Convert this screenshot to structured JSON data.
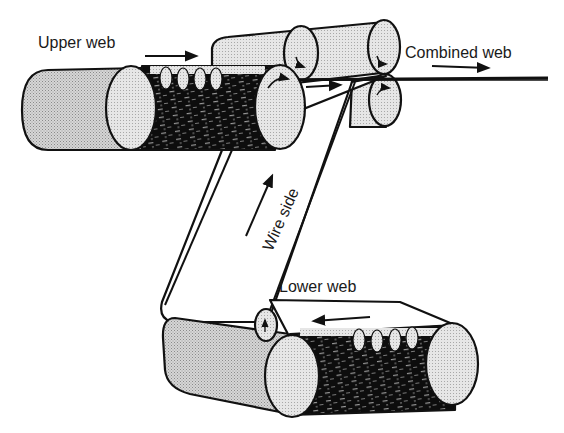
{
  "diagram": {
    "type": "process-schematic",
    "labels": {
      "upper_web": "Upper web",
      "combined_web": "Combined web",
      "wire_side": "Wire side",
      "lower_web": "Lower web"
    },
    "components": [
      {
        "id": "upper-wire-cylinder",
        "description": "Upper forming cylinder with wire mesh section"
      },
      {
        "id": "upper-couch-roll-left",
        "description": "Upper press roll (left)"
      },
      {
        "id": "upper-couch-roll-right",
        "description": "Upper press roll (right)"
      },
      {
        "id": "lower-nip-roll",
        "description": "Lower nip roll"
      },
      {
        "id": "lower-wire-cylinder",
        "description": "Lower forming cylinder with wire mesh section"
      },
      {
        "id": "lower-guide-roll",
        "description": "Lower small guide roll"
      },
      {
        "id": "wire-belt",
        "description": "Transfer belt carrying lower web upward"
      }
    ],
    "flow_arrows": [
      {
        "id": "upper-web-arrow",
        "direction": "right"
      },
      {
        "id": "combined-web-arrow",
        "direction": "right"
      },
      {
        "id": "nip-arrow",
        "direction": "right"
      },
      {
        "id": "wire-side-arrow",
        "direction": "up"
      },
      {
        "id": "lower-web-arrow",
        "direction": "left"
      }
    ],
    "colors": {
      "outline": "#111111",
      "shaded": "#c8c8c8",
      "end_cap": "#e2e2e2",
      "mesh": "#0d0d0d",
      "background": "#ffffff"
    }
  }
}
